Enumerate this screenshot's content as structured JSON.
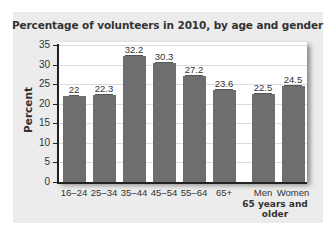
{
  "chart_data": {
    "type": "bar",
    "title": "Percentage of volunteers in 2010, by age and gender",
    "xlabel": "",
    "ylabel": "Percent",
    "ylim": [
      0,
      35
    ],
    "yticks": [
      0,
      5,
      10,
      15,
      20,
      25,
      30,
      35
    ],
    "grid": true,
    "legend": null,
    "categories": [
      "16–24",
      "25–34",
      "35–44",
      "45–54",
      "55–64",
      "65+",
      "Men",
      "Women"
    ],
    "values": [
      22,
      22.3,
      32.2,
      30.3,
      27.2,
      23.6,
      22.5,
      24.5
    ],
    "value_labels": [
      "22",
      "22.3",
      "32.2",
      "30.3",
      "27.2",
      "23.6",
      "22.5",
      "24.5"
    ],
    "group_label": "65 years and older",
    "group_categories": [
      "Men",
      "Women"
    ],
    "bar_color": "#6d6e70"
  },
  "title": "Percentage of volunteers in 2010, by age and gender",
  "ylabel": "Percent",
  "group_label": "65 years and older"
}
